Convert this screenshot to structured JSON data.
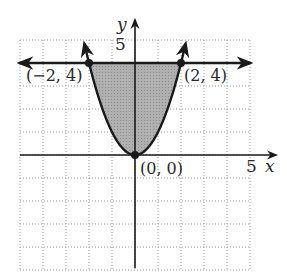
{
  "chart_data": {
    "type": "line",
    "title": "",
    "xlabel": "x",
    "ylabel": "y",
    "xlim": [
      -5,
      5
    ],
    "ylim": [
      -5,
      5
    ],
    "grid": true,
    "x_tick_label": "5",
    "y_tick_label": "5",
    "series": [
      {
        "name": "parabola",
        "equation": "y = x^2",
        "x": [
          -2.2,
          -2,
          -1,
          0,
          1,
          2,
          2.2
        ],
        "y": [
          4.84,
          4,
          1,
          0,
          1,
          4,
          4.84
        ]
      },
      {
        "name": "horizontal line",
        "equation": "y = 4",
        "x": [
          -5.5,
          5.5
        ],
        "y": [
          4,
          4
        ]
      }
    ],
    "shaded_region": {
      "description": "region between y = x^2 and y = 4",
      "x_range": [
        -2,
        2
      ]
    },
    "points": [
      {
        "label": "(−2, 4)",
        "x": -2,
        "y": 4
      },
      {
        "label": "(2, 4)",
        "x": 2,
        "y": 4
      },
      {
        "label": "(0, 0)",
        "x": 0,
        "y": 0
      }
    ]
  },
  "labels": {
    "y_axis": "y",
    "x_axis": "x",
    "y_tick": "5",
    "x_tick": "5",
    "point_left": "(−2, 4)",
    "point_right": "(2, 4)",
    "point_origin": "(0, 0)"
  },
  "colors": {
    "ink": "#1a1a1a",
    "shade": "#a8a8a8",
    "grid": "#9a9a9a"
  }
}
